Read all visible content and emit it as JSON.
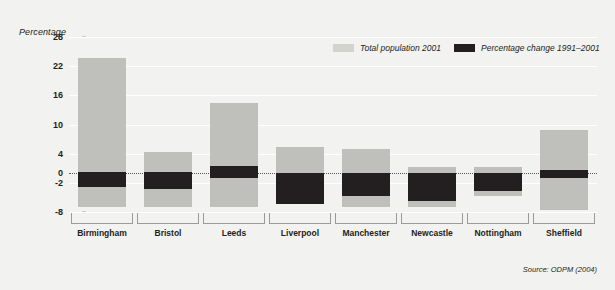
{
  "chart_data": {
    "type": "bar",
    "title": "",
    "subtitle": "",
    "ylabel": "Percentage",
    "xlabel": "",
    "ylim": [
      -8,
      28
    ],
    "grid": true,
    "legend_position": "top-right",
    "yticks": [
      28,
      22,
      16,
      10,
      4,
      0,
      -2,
      -8
    ],
    "ytick_labels": [
      "28",
      "22",
      "16",
      "10",
      "4",
      "0",
      "-2",
      "-8"
    ],
    "categories": [
      "Birmingham",
      "Bristol",
      "Leeds",
      "Liverpool",
      "Manchester",
      "Newcastle",
      "Nottingham",
      "Sheffield"
    ],
    "series": [
      {
        "name": "Total population 2001",
        "color": "#bfbfbb",
        "type": "range",
        "tops": [
          23.7,
          4.3,
          14.5,
          5.4,
          5.0,
          1.3,
          1.2,
          8.8
        ],
        "bottoms": [
          -7.0,
          -7.0,
          -7.0,
          -6.3,
          -7.0,
          -7.0,
          -4.8,
          -7.6
        ]
      },
      {
        "name": "Percentage change 1991–2001",
        "color": "#231f20",
        "type": "range",
        "tops": [
          0.2,
          0.2,
          1.5,
          0.0,
          0.0,
          0.0,
          0.0,
          0.6
        ],
        "bottoms": [
          -2.9,
          -3.3,
          -1.0,
          -6.3,
          -4.7,
          -5.7,
          -3.7,
          -1.0
        ]
      }
    ]
  },
  "axis": {
    "y_title": "Percentage"
  },
  "legend": {
    "items": [
      {
        "label": "Total population 2001",
        "swatch": "light"
      },
      {
        "label": "Percentage change 1991–2001",
        "swatch": "dark"
      }
    ]
  },
  "footer": {
    "source": "Source: ODPM (2004)"
  }
}
